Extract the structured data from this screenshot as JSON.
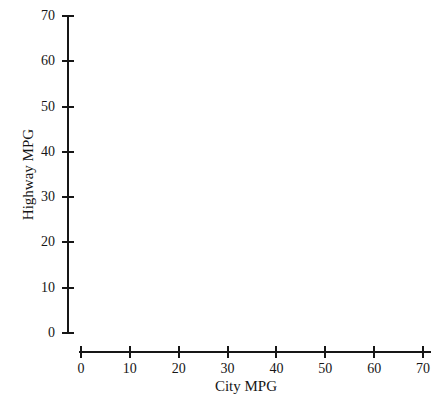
{
  "chart_data": {
    "type": "scatter",
    "title": "",
    "subtitle": "",
    "xlabel": "City MPG",
    "ylabel": "Highway MPG",
    "xlim": [
      0,
      70
    ],
    "ylim": [
      0,
      70
    ],
    "xticks": [
      0,
      10,
      20,
      30,
      40,
      50,
      60,
      70
    ],
    "yticks": [
      0,
      10,
      20,
      30,
      40,
      50,
      60,
      70
    ],
    "xtick_labels": [
      "0",
      "10",
      "20",
      "30",
      "40",
      "50",
      "60",
      "70"
    ],
    "ytick_labels": [
      "0",
      "10",
      "20",
      "30",
      "40",
      "50",
      "60",
      "70"
    ],
    "grid": false,
    "legend": null,
    "legend_position": "none",
    "annotations": [],
    "series": [
      {
        "name": "",
        "x": [],
        "y": []
      }
    ],
    "note": "Blank axes template — no data points are plotted in the figure."
  },
  "axes": {
    "x_axis": {
      "label": "City MPG",
      "ticks": [
        {
          "value": 0,
          "label": "0"
        },
        {
          "value": 10,
          "label": "10"
        },
        {
          "value": 20,
          "label": "20"
        },
        {
          "value": 30,
          "label": "30"
        },
        {
          "value": 40,
          "label": "40"
        },
        {
          "value": 50,
          "label": "50"
        },
        {
          "value": 60,
          "label": "60"
        },
        {
          "value": 70,
          "label": "70"
        }
      ]
    },
    "y_axis": {
      "label": "Highway MPG",
      "ticks": [
        {
          "value": 0,
          "label": "0"
        },
        {
          "value": 10,
          "label": "10"
        },
        {
          "value": 20,
          "label": "20"
        },
        {
          "value": 30,
          "label": "30"
        },
        {
          "value": 40,
          "label": "40"
        },
        {
          "value": 50,
          "label": "50"
        },
        {
          "value": 60,
          "label": "60"
        },
        {
          "value": 70,
          "label": "70"
        }
      ]
    }
  },
  "colors": {
    "ink": "#161616",
    "background": "#ffffff"
  }
}
